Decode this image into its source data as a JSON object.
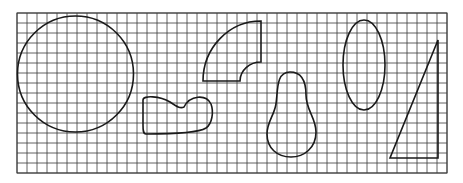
{
  "figure": {
    "background": "#ffffff",
    "ink_color": "#1a1a1a",
    "grid_color": "#3a3a3a",
    "grid": {
      "x": 17,
      "y": 13,
      "width": 430,
      "height": 160,
      "cell": 10
    }
  },
  "shapes": [
    {
      "name": "circle",
      "cx": 75.5,
      "cy": 74,
      "r": 58
    },
    {
      "name": "irregular-blob",
      "path": "M143,100 C143,95 160,96 170,102 C176,106 180,109 184,107 C190,95 206,94 211,104 C214,112 212,124 206,128 C198,133 170,134 146,134 C143,134 143,130 143,125 Z"
    },
    {
      "name": "quarter-annulus",
      "path": "M203,81 A58,60 0 0 1 261,21 L261,62 A21,19 0 0 0 240,81 Z"
    },
    {
      "name": "pear-shape",
      "path": "M290,72 C302,72 306,82 306,95 C306,110 316,118 316,132 C316,148 304,157 291,157 C277,157 267,148 267,134 C267,122 274,116 276,104 C278,90 276,72 290,72 Z"
    },
    {
      "name": "ellipse",
      "cx": 364,
      "cy": 65,
      "rx": 21,
      "ry": 45
    },
    {
      "name": "right-triangle",
      "points": "438,40 438,158 390,158"
    }
  ]
}
